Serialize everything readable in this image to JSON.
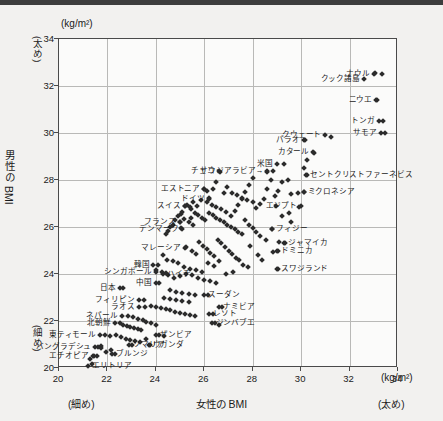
{
  "chart_data": {
    "type": "scatter",
    "title": "",
    "xlabel": "女性の BMI",
    "ylabel": "男性の BMI",
    "x_unit": "(kg/m²)",
    "y_unit": "(kg/m²)",
    "x_low_note": "(細め)",
    "x_high_note": "(太め)",
    "y_low_note": "(細め)",
    "y_high_note": "(太め)",
    "xlim": [
      20,
      34
    ],
    "ylim": [
      20,
      34
    ],
    "xticks": [
      20,
      22,
      24,
      26,
      28,
      30,
      32,
      34
    ],
    "yticks": [
      20,
      22,
      24,
      26,
      28,
      30,
      32,
      34
    ],
    "grid": true,
    "legend": "none",
    "marker": "diamond",
    "marker_color": "#2b2b2b",
    "labeled_points": [
      {
        "label": "ナウル",
        "x": 33.0,
        "y": 32.5,
        "side": "r"
      },
      {
        "label": "クック諸島",
        "x": 32.6,
        "y": 32.3,
        "side": "r"
      },
      {
        "label": "ニウエ",
        "x": 33.1,
        "y": 31.4,
        "side": "r"
      },
      {
        "label": "トンガ",
        "x": 33.2,
        "y": 30.5,
        "side": "r"
      },
      {
        "label": "サモア",
        "x": 33.3,
        "y": 30.0,
        "side": "r"
      },
      {
        "label": "クウェート",
        "x": 31.0,
        "y": 29.9,
        "side": "r"
      },
      {
        "label": "パラオ",
        "x": 30.1,
        "y": 29.7,
        "side": "r"
      },
      {
        "label": "カタール",
        "x": 30.5,
        "y": 29.2,
        "side": "r"
      },
      {
        "label": "セントクリストファーネビス",
        "x": 30.2,
        "y": 28.2,
        "side": "l"
      },
      {
        "label": "ミクロネシア",
        "x": 30.1,
        "y": 27.5,
        "side": "l"
      },
      {
        "label": "米国",
        "x": 29.0,
        "y": 28.7,
        "side": "r"
      },
      {
        "label": "サウジアラビア→",
        "x": 28.6,
        "y": 28.4,
        "side": "r"
      },
      {
        "label": "チェコ",
        "x": 26.6,
        "y": 28.4,
        "side": "r"
      },
      {
        "label": "エストニア",
        "x": 26.0,
        "y": 27.6,
        "side": "r"
      },
      {
        "label": "ドイツ",
        "x": 26.2,
        "y": 27.2,
        "side": "r"
      },
      {
        "label": "スイス",
        "x": 25.2,
        "y": 26.9,
        "side": "r"
      },
      {
        "label": "フランス",
        "x": 25.0,
        "y": 26.2,
        "side": "r"
      },
      {
        "label": "デンマーク",
        "x": 25.1,
        "y": 25.9,
        "side": "r"
      },
      {
        "label": "エジプト",
        "x": 30.0,
        "y": 26.9,
        "side": "r"
      },
      {
        "label": "フィジー",
        "x": 28.8,
        "y": 25.9,
        "side": "l"
      },
      {
        "label": "ジャマイカ",
        "x": 29.3,
        "y": 25.3,
        "side": "l"
      },
      {
        "label": "ドミニカ",
        "x": 29.0,
        "y": 25.0,
        "side": "l"
      },
      {
        "label": "マレーシア",
        "x": 25.2,
        "y": 25.1,
        "side": "r"
      },
      {
        "label": "スワジランド",
        "x": 29.0,
        "y": 24.2,
        "side": "l"
      },
      {
        "label": "韓国",
        "x": 23.9,
        "y": 24.4,
        "side": "r"
      },
      {
        "label": "シンガポール",
        "x": 24.0,
        "y": 24.1,
        "side": "r"
      },
      {
        "label": "ハイチ",
        "x": 24.3,
        "y": 24.0,
        "side": "l"
      },
      {
        "label": "中国",
        "x": 24.0,
        "y": 23.6,
        "side": "r"
      },
      {
        "label": "日本",
        "x": 22.5,
        "y": 23.4,
        "side": "r"
      },
      {
        "label": "スーダン",
        "x": 26.0,
        "y": 23.1,
        "side": "l"
      },
      {
        "label": "フィリピン",
        "x": 23.3,
        "y": 22.9,
        "side": "r"
      },
      {
        "label": "ラオス",
        "x": 23.3,
        "y": 22.6,
        "side": "r"
      },
      {
        "label": "ナミビア",
        "x": 26.6,
        "y": 22.6,
        "side": "l"
      },
      {
        "label": "レソト",
        "x": 26.2,
        "y": 22.3,
        "side": "l"
      },
      {
        "label": "ネパール",
        "x": 22.6,
        "y": 22.2,
        "side": "r"
      },
      {
        "label": "北朝鮮",
        "x": 22.3,
        "y": 21.9,
        "side": "r"
      },
      {
        "label": "ジンバブエ",
        "x": 26.3,
        "y": 21.9,
        "side": "l"
      },
      {
        "label": "東ティモール",
        "x": 21.7,
        "y": 21.4,
        "side": "r"
      },
      {
        "label": "ザンビア",
        "x": 24.0,
        "y": 21.4,
        "side": "l"
      },
      {
        "label": "ウガンダ",
        "x": 23.7,
        "y": 21.0,
        "side": "l"
      },
      {
        "label": "ソマリア",
        "x": 22.9,
        "y": 21.0,
        "side": "l"
      },
      {
        "label": "バングラデシュ",
        "x": 21.5,
        "y": 20.9,
        "side": "r"
      },
      {
        "label": "ブルンジ",
        "x": 22.2,
        "y": 20.6,
        "side": "l"
      },
      {
        "label": "エチオピア",
        "x": 21.4,
        "y": 20.5,
        "side": "r"
      },
      {
        "label": "エリトリア",
        "x": 21.2,
        "y": 20.1,
        "side": "l"
      }
    ],
    "points": [
      [
        33.05,
        32.55
      ],
      [
        33.35,
        32.5
      ],
      [
        33.15,
        31.4
      ],
      [
        33.4,
        30.5
      ],
      [
        33.45,
        30.0
      ],
      [
        30.15,
        29.7
      ],
      [
        31.25,
        29.85
      ],
      [
        30.55,
        29.15
      ],
      [
        30.25,
        28.85
      ],
      [
        30.1,
        28.5
      ],
      [
        29.3,
        28.7
      ],
      [
        28.85,
        28.4
      ],
      [
        28.6,
        28.35
      ],
      [
        30.25,
        28.2
      ],
      [
        30.1,
        27.5
      ],
      [
        29.85,
        27.45
      ],
      [
        29.6,
        27.4
      ],
      [
        29.45,
        28.0
      ],
      [
        29.2,
        27.9
      ],
      [
        29.05,
        27.55
      ],
      [
        28.9,
        27.3
      ],
      [
        28.75,
        28.0
      ],
      [
        28.6,
        27.6
      ],
      [
        28.45,
        27.2
      ],
      [
        28.3,
        27.0
      ],
      [
        28.15,
        26.8
      ],
      [
        29.9,
        26.85
      ],
      [
        29.5,
        26.6
      ],
      [
        29.2,
        26.45
      ],
      [
        28.95,
        26.9
      ],
      [
        28.0,
        28.1
      ],
      [
        27.85,
        27.8
      ],
      [
        27.7,
        27.5
      ],
      [
        27.55,
        27.2
      ],
      [
        27.4,
        26.95
      ],
      [
        27.25,
        26.7
      ],
      [
        27.1,
        26.45
      ],
      [
        26.95,
        27.7
      ],
      [
        26.8,
        27.45
      ],
      [
        26.65,
        28.35
      ],
      [
        26.5,
        27.9
      ],
      [
        26.35,
        27.6
      ],
      [
        26.2,
        27.25
      ],
      [
        26.1,
        27.55
      ],
      [
        26.0,
        27.6
      ],
      [
        25.85,
        27.15
      ],
      [
        25.7,
        26.9
      ],
      [
        25.55,
        27.05
      ],
      [
        25.4,
        26.85
      ],
      [
        25.3,
        26.95
      ],
      [
        25.2,
        26.9
      ],
      [
        25.1,
        26.65
      ],
      [
        25.0,
        26.2
      ],
      [
        25.05,
        25.95
      ],
      [
        24.9,
        26.45
      ],
      [
        24.8,
        26.3
      ],
      [
        24.7,
        26.1
      ],
      [
        24.6,
        26.0
      ],
      [
        24.5,
        25.85
      ],
      [
        24.4,
        25.7
      ],
      [
        25.45,
        26.75
      ],
      [
        25.6,
        26.6
      ],
      [
        25.75,
        26.5
      ],
      [
        25.9,
        26.4
      ],
      [
        26.05,
        26.3
      ],
      [
        26.2,
        26.6
      ],
      [
        26.35,
        26.5
      ],
      [
        26.5,
        26.4
      ],
      [
        26.65,
        26.3
      ],
      [
        26.8,
        26.2
      ],
      [
        26.95,
        26.1
      ],
      [
        27.1,
        26.0
      ],
      [
        27.25,
        25.9
      ],
      [
        27.4,
        25.8
      ],
      [
        27.55,
        25.7
      ],
      [
        27.7,
        26.3
      ],
      [
        27.85,
        26.1
      ],
      [
        28.0,
        25.95
      ],
      [
        28.15,
        25.8
      ],
      [
        28.3,
        25.6
      ],
      [
        28.8,
        25.9
      ],
      [
        29.35,
        25.3
      ],
      [
        29.1,
        25.35
      ],
      [
        29.05,
        25.0
      ],
      [
        28.85,
        24.95
      ],
      [
        25.25,
        25.15
      ],
      [
        25.5,
        25.0
      ],
      [
        25.65,
        24.85
      ],
      [
        25.8,
        25.35
      ],
      [
        25.95,
        25.2
      ],
      [
        26.1,
        25.05
      ],
      [
        26.25,
        24.9
      ],
      [
        26.4,
        24.75
      ],
      [
        26.55,
        25.45
      ],
      [
        26.7,
        25.3
      ],
      [
        26.85,
        25.15
      ],
      [
        27.0,
        25.0
      ],
      [
        27.15,
        24.85
      ],
      [
        27.3,
        24.7
      ],
      [
        27.45,
        24.6
      ],
      [
        24.1,
        24.4
      ],
      [
        24.0,
        24.15
      ],
      [
        24.25,
        24.1
      ],
      [
        24.4,
        24.05
      ],
      [
        22.65,
        23.4
      ],
      [
        24.15,
        23.6
      ],
      [
        24.5,
        23.95
      ],
      [
        24.75,
        23.85
      ],
      [
        25.0,
        23.9
      ],
      [
        25.25,
        24.0
      ],
      [
        25.5,
        23.95
      ],
      [
        25.75,
        23.85
      ],
      [
        26.0,
        23.75
      ],
      [
        26.25,
        23.7
      ],
      [
        26.5,
        23.6
      ],
      [
        24.6,
        23.3
      ],
      [
        24.85,
        23.25
      ],
      [
        25.1,
        23.2
      ],
      [
        25.35,
        23.15
      ],
      [
        25.6,
        23.1
      ],
      [
        24.35,
        23.0
      ],
      [
        24.6,
        22.95
      ],
      [
        24.85,
        22.9
      ],
      [
        25.1,
        22.85
      ],
      [
        25.35,
        22.8
      ],
      [
        29.05,
        24.2
      ],
      [
        26.15,
        23.1
      ],
      [
        23.5,
        22.9
      ],
      [
        23.55,
        22.6
      ],
      [
        23.8,
        22.65
      ],
      [
        24.0,
        22.6
      ],
      [
        24.2,
        22.55
      ],
      [
        24.4,
        22.5
      ],
      [
        24.6,
        22.45
      ],
      [
        24.8,
        22.4
      ],
      [
        25.0,
        22.35
      ],
      [
        25.2,
        22.3
      ],
      [
        25.4,
        22.25
      ],
      [
        25.6,
        22.2
      ],
      [
        26.75,
        22.6
      ],
      [
        26.35,
        22.3
      ],
      [
        22.85,
        22.2
      ],
      [
        23.05,
        22.15
      ],
      [
        23.25,
        22.1
      ],
      [
        23.45,
        22.05
      ],
      [
        22.5,
        21.9
      ],
      [
        22.65,
        21.85
      ],
      [
        22.8,
        21.8
      ],
      [
        22.95,
        21.75
      ],
      [
        23.1,
        21.7
      ],
      [
        23.25,
        21.65
      ],
      [
        23.4,
        21.6
      ],
      [
        23.6,
        21.95
      ],
      [
        23.8,
        21.9
      ],
      [
        24.0,
        21.85
      ],
      [
        26.45,
        21.9
      ],
      [
        26.6,
        21.85
      ],
      [
        21.9,
        21.4
      ],
      [
        22.1,
        21.35
      ],
      [
        22.35,
        21.4
      ],
      [
        22.55,
        21.3
      ],
      [
        22.75,
        21.25
      ],
      [
        22.95,
        21.2
      ],
      [
        23.15,
        21.15
      ],
      [
        23.35,
        21.1
      ],
      [
        24.15,
        21.4
      ],
      [
        24.35,
        21.35
      ],
      [
        23.75,
        21.0
      ],
      [
        23.0,
        21.0
      ],
      [
        22.3,
        20.6
      ],
      [
        21.75,
        20.95
      ],
      [
        21.75,
        20.85
      ],
      [
        21.6,
        20.9
      ],
      [
        21.55,
        20.5
      ],
      [
        21.45,
        20.5
      ],
      [
        21.35,
        20.15
      ],
      [
        21.3,
        20.4
      ],
      [
        21.95,
        20.7
      ],
      [
        22.15,
        20.75
      ],
      [
        23.6,
        21.25
      ],
      [
        27.6,
        24.4
      ],
      [
        27.8,
        24.3
      ],
      [
        27.2,
        24.1
      ],
      [
        26.9,
        24.0
      ],
      [
        26.6,
        24.55
      ],
      [
        28.2,
        24.8
      ],
      [
        28.4,
        24.6
      ],
      [
        27.9,
        25.2
      ],
      [
        28.55,
        25.45
      ],
      [
        29.6,
        26.2
      ],
      [
        24.9,
        24.45
      ],
      [
        25.15,
        24.3
      ],
      [
        25.4,
        24.2
      ],
      [
        25.65,
        24.15
      ],
      [
        25.9,
        24.1
      ],
      [
        26.15,
        24.45
      ],
      [
        26.4,
        24.35
      ],
      [
        24.7,
        24.55
      ],
      [
        24.45,
        24.6
      ],
      [
        24.3,
        24.8
      ],
      [
        25.05,
        26.55
      ],
      [
        25.15,
        26.35
      ],
      [
        25.35,
        26.2
      ],
      [
        25.55,
        26.1
      ],
      [
        25.45,
        26.4
      ],
      [
        26.1,
        27.05
      ],
      [
        26.3,
        26.95
      ],
      [
        26.5,
        26.85
      ],
      [
        26.7,
        26.75
      ],
      [
        26.9,
        26.65
      ],
      [
        27.15,
        27.45
      ],
      [
        27.35,
        27.35
      ],
      [
        27.55,
        27.25
      ],
      [
        27.75,
        27.15
      ],
      [
        28.0,
        27.05
      ]
    ]
  }
}
